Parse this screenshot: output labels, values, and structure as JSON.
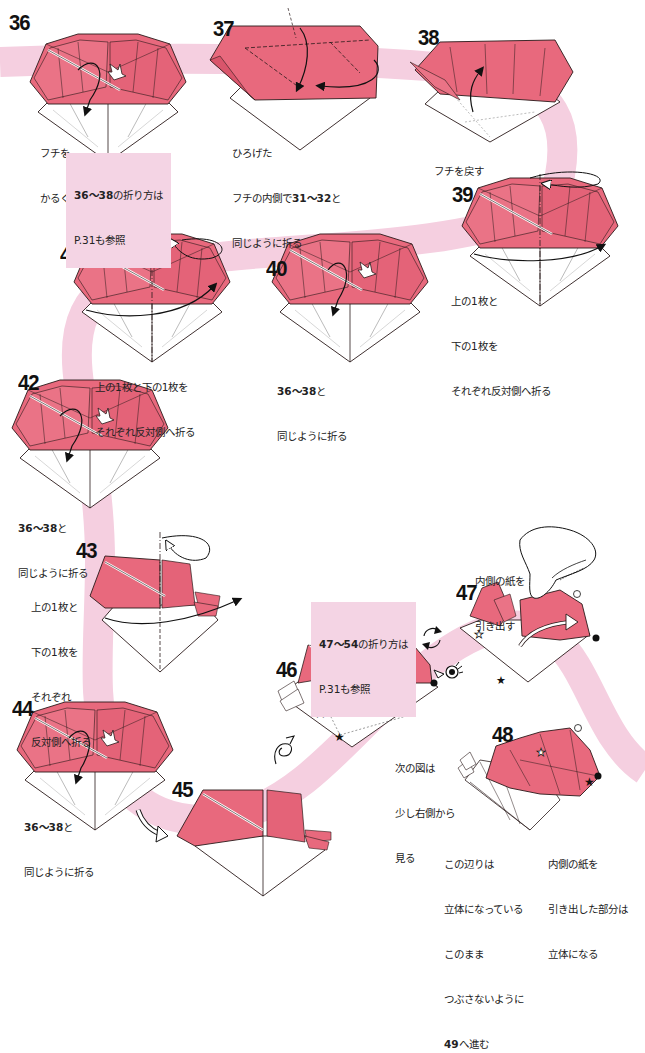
{
  "colors": {
    "ribbon": "#f5cfe0",
    "paper_pink": "#e8697d",
    "paper_pink_dark": "#d9556b",
    "paper_white": "#ffffff",
    "line": "#2a1a1a",
    "note_bg": "#f4d4e4"
  },
  "steps": [
    {
      "id": "36",
      "number": "36",
      "caption_lines": [
        "フチを",
        "かるくひろげる"
      ]
    },
    {
      "id": "37",
      "number": "37",
      "caption_lines": [
        "ひろげた",
        "フチの内側で31〜32と",
        "同じように折る"
      ]
    },
    {
      "id": "38",
      "number": "38",
      "caption_lines": [
        "フチを戻す"
      ]
    },
    {
      "id": "39",
      "number": "39",
      "caption_lines": [
        "上の1枚と",
        "下の1枚を",
        "それぞれ反対側へ折る"
      ]
    },
    {
      "id": "40",
      "number": "40",
      "caption_lines": [
        "36〜38と",
        "同じように折る"
      ]
    },
    {
      "id": "41",
      "number": "41",
      "caption_lines": [
        "上の1枚と下の1枚を",
        "それぞれ反対側へ折る"
      ]
    },
    {
      "id": "42",
      "number": "42",
      "caption_lines": [
        "36〜38と",
        "同じように折る"
      ]
    },
    {
      "id": "43",
      "number": "43",
      "caption_lines": [
        "上の1枚と",
        "下の1枚を",
        "それぞれ",
        "反対側へ折る"
      ]
    },
    {
      "id": "44",
      "number": "44",
      "caption_lines": [
        "36〜38と",
        "同じように折る"
      ]
    },
    {
      "id": "45",
      "number": "45",
      "caption_lines": []
    },
    {
      "id": "46",
      "number": "46",
      "caption_lines": [
        "次の図は",
        "少し右側から",
        "見る"
      ]
    },
    {
      "id": "47",
      "number": "47",
      "caption_lines": [
        "内側の紙を",
        "引き出す"
      ]
    },
    {
      "id": "48",
      "number": "48",
      "caption_left_lines": [
        "この辺りは",
        "立体になっている",
        "このまま",
        "つぶさないように",
        "49へ進む"
      ],
      "caption_right_lines": [
        "内側の紙を",
        "引き出した部分は",
        "立体になる"
      ]
    }
  ],
  "notes": [
    {
      "id": "note-36-38",
      "bold": "36〜38",
      "text1": "の折り方は",
      "text2": "P.31も参照"
    },
    {
      "id": "note-47-54",
      "bold": "47〜54",
      "text1": "の折り方は",
      "text2": "P.31も参照"
    }
  ],
  "captions": {
    "s36": {
      "l1": "フチを",
      "l2": "かるくひろげる"
    },
    "s37": {
      "l1": "ひろげた",
      "l2a": "フチの内側で",
      "l2b": "31〜32",
      "l2c": "と",
      "l3": "同じように折る"
    },
    "s38": {
      "l1": "フチを戻す"
    },
    "s39": {
      "l1": "上の1枚と",
      "l2": "下の1枚を",
      "l3": "それぞれ反対側へ折る"
    },
    "s40": {
      "l1b": "36〜38",
      "l1c": "と",
      "l2": "同じように折る"
    },
    "s41": {
      "l1": "上の1枚と下の1枚を",
      "l2": "それぞれ反対側へ折る"
    },
    "s42": {
      "l1b": "36〜38",
      "l1c": "と",
      "l2": "同じように折る"
    },
    "s43": {
      "l1": "上の1枚と",
      "l2": "下の1枚を",
      "l3": "それぞれ",
      "l4": "反対側へ折る"
    },
    "s44": {
      "l1b": "36〜38",
      "l1c": "と",
      "l2": "同じように折る"
    },
    "s46": {
      "l1": "次の図は",
      "l2": "少し右側から",
      "l3": "見る"
    },
    "s47": {
      "l1": "内側の紙を",
      "l2": "引き出す"
    },
    "s48_left": {
      "l1": "この辺りは",
      "l2": "立体になっている",
      "l3": "このまま",
      "l4": "つぶさないように",
      "l5b": "49",
      "l5c": "へ進む"
    },
    "s48_right": {
      "l1": "内側の紙を",
      "l2": "引き出した部分は",
      "l3": "立体になる"
    }
  },
  "icons": [
    "valley-fold-arrow",
    "push-arrow",
    "turn-over-icon",
    "rotate-icon",
    "view-eye-icon",
    "hand-icon",
    "white-star-marker",
    "black-star-marker",
    "white-dot-marker",
    "black-dot-marker"
  ]
}
